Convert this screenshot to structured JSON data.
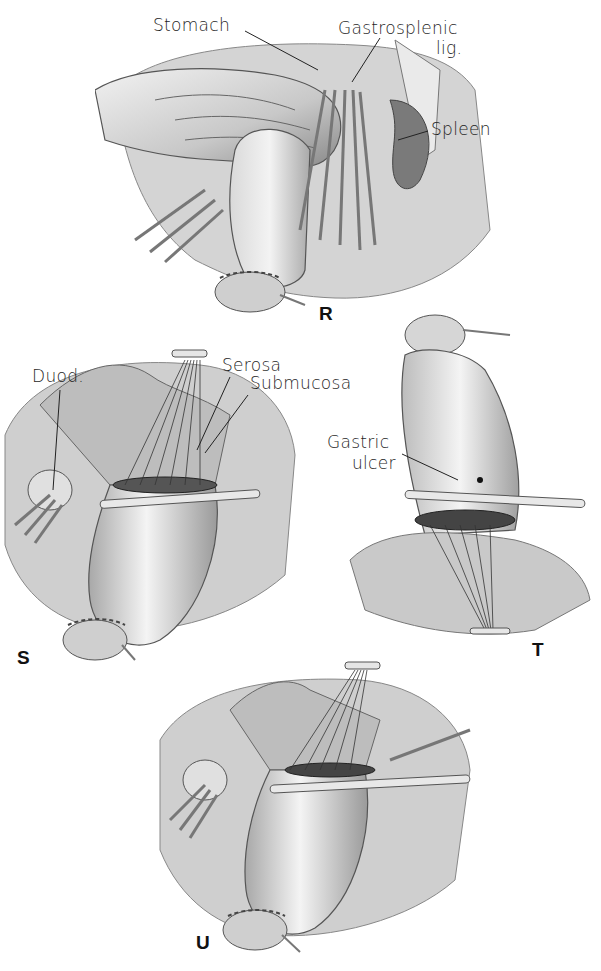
{
  "figure": {
    "type": "surgical-illustration-plate",
    "panels": [
      {
        "id": "R",
        "panel_label": "R",
        "annotations": [
          "Stomach",
          "Gastrosplenic lig.",
          "Spleen"
        ]
      },
      {
        "id": "S",
        "panel_label": "S",
        "annotations": [
          "Duod.",
          "Serosa",
          "Submucosa"
        ]
      },
      {
        "id": "T",
        "panel_label": "T",
        "annotations": [
          "Gastric ulcer"
        ]
      },
      {
        "id": "U",
        "panel_label": "U",
        "annotations": []
      }
    ]
  },
  "panelR": {
    "label": "R",
    "stomach": "Stomach",
    "gastrosplenic_line1": "Gastrosplenic",
    "gastrosplenic_line2": "lig.",
    "spleen": "Spleen"
  },
  "panelS": {
    "label": "S",
    "duod": "Duod.",
    "serosa": "Serosa",
    "submucosa": "Submucosa"
  },
  "panelT": {
    "label": "T",
    "gastric_line1": "Gastric",
    "gastric_line2": "ulcer"
  },
  "panelU": {
    "label": "U"
  },
  "colors": {
    "ink": "#1f1f1f",
    "background": "#ffffff",
    "tissue_light": "#e6e6e6",
    "tissue_mid": "#b9b9b9",
    "tissue_dark": "#6e6e6e"
  }
}
